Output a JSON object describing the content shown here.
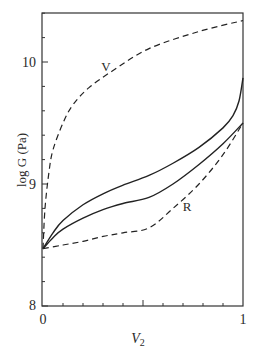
{
  "chart_data": {
    "type": "line",
    "title": "",
    "xlabel": "V₂",
    "ylabel": "log G (Pa)",
    "xlim": [
      0,
      1
    ],
    "ylim": [
      8,
      10.4
    ],
    "x_ticks": [
      0,
      1
    ],
    "x_tick_labels": [
      "0",
      "1"
    ],
    "x_minor_step": 0.1,
    "y_ticks": [
      8,
      9,
      10
    ],
    "y_tick_labels": [
      "8",
      "9",
      "10"
    ],
    "y_minor_step": 0.2,
    "grid": false,
    "legend": "none (inline labels)",
    "annotations": [
      {
        "text": "V",
        "x": 0.31,
        "y": 9.97
      },
      {
        "text": "R",
        "x": 0.72,
        "y": 8.8
      }
    ],
    "series": [
      {
        "name": "V",
        "style": "dashed",
        "x": [
          0.0,
          0.01,
          0.03,
          0.05,
          0.1,
          0.15,
          0.23,
          0.35,
          0.53,
          0.78,
          1.0
        ],
        "y": [
          8.47,
          8.8,
          9.1,
          9.28,
          9.5,
          9.65,
          9.79,
          9.93,
          10.11,
          10.25,
          10.34
        ]
      },
      {
        "name": "upper solid",
        "style": "solid",
        "x": [
          0.0,
          0.05,
          0.1,
          0.2,
          0.3,
          0.4,
          0.53,
          0.65,
          0.78,
          0.9,
          0.95,
          0.98,
          1.0
        ],
        "y": [
          8.47,
          8.6,
          8.7,
          8.83,
          8.92,
          8.99,
          9.07,
          9.17,
          9.3,
          9.46,
          9.56,
          9.68,
          9.87
        ]
      },
      {
        "name": "lower solid",
        "style": "solid",
        "x": [
          0.0,
          0.05,
          0.1,
          0.2,
          0.3,
          0.4,
          0.53,
          0.65,
          0.78,
          0.9,
          1.0
        ],
        "y": [
          8.47,
          8.56,
          8.63,
          8.72,
          8.79,
          8.84,
          8.89,
          9.0,
          9.16,
          9.33,
          9.5
        ]
      },
      {
        "name": "R",
        "style": "dashed",
        "x": [
          0.0,
          0.1,
          0.2,
          0.3,
          0.4,
          0.53,
          0.65,
          0.78,
          0.9,
          1.0
        ],
        "y": [
          8.47,
          8.5,
          8.53,
          8.57,
          8.6,
          8.64,
          8.8,
          9.0,
          9.24,
          9.5
        ]
      }
    ]
  },
  "labels": {
    "y_axis_title": "log G (Pa)",
    "x_axis_title_main": "V",
    "x_axis_title_sub": "2",
    "curve_v": "V",
    "curve_r": "R",
    "tick_y_8": "8",
    "tick_y_9": "9",
    "tick_y_10": "10",
    "tick_x_0": "0",
    "tick_x_1": "1"
  }
}
